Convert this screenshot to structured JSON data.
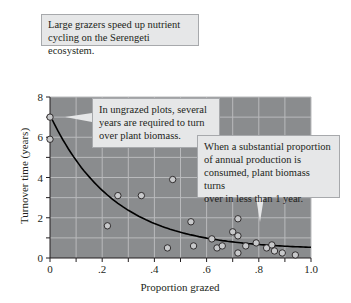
{
  "title_box": {
    "line1": "Large grazers speed up nutrient",
    "line2": "cycling on the Serengeti ecosystem."
  },
  "callouts": [
    {
      "lines": [
        "In ungrazed plots, several",
        "years are required to turn",
        "over plant biomass."
      ]
    },
    {
      "lines": [
        "When a substantial proportion",
        "of annual production is",
        "consumed, plant biomass turns",
        "over in less than 1 year."
      ]
    }
  ],
  "colors": {
    "plot_bg": "#8a8c8e",
    "grid": "#b9babc",
    "curve": "#000000",
    "point_fill": "#c8c9cb",
    "point_stroke": "#231f20",
    "callout_bg": "#e6e7e8"
  },
  "chart_data": {
    "type": "scatter",
    "title": "Large grazers speed up nutrient cycling on the Serengeti ecosystem.",
    "xlabel": "Proportion grazed",
    "ylabel": "Turnover time (years)",
    "xlim": [
      0,
      1.0
    ],
    "ylim": [
      0,
      8
    ],
    "x_ticks": [
      0,
      0.1,
      0.2,
      0.3,
      0.4,
      0.5,
      0.6,
      0.7,
      0.8,
      0.9,
      1.0
    ],
    "x_tick_labels": [
      "0",
      ".2",
      ".4",
      ".6",
      ".8",
      "1.0"
    ],
    "y_ticks": [
      0,
      1,
      2,
      3,
      4,
      5,
      6,
      7,
      8
    ],
    "y_tick_labels": [
      "0",
      "2",
      "4",
      "6",
      "8"
    ],
    "grid": true,
    "series": [
      {
        "name": "Plots",
        "points": [
          [
            0.0,
            7.0
          ],
          [
            0.0,
            5.9
          ],
          [
            0.22,
            1.6
          ],
          [
            0.26,
            3.1
          ],
          [
            0.35,
            3.1
          ],
          [
            0.45,
            0.5
          ],
          [
            0.47,
            3.9
          ],
          [
            0.54,
            1.8
          ],
          [
            0.55,
            0.6
          ],
          [
            0.62,
            0.95
          ],
          [
            0.64,
            0.5
          ],
          [
            0.66,
            0.6
          ],
          [
            0.7,
            1.3
          ],
          [
            0.72,
            1.95
          ],
          [
            0.72,
            1.1
          ],
          [
            0.72,
            0.25
          ],
          [
            0.75,
            0.6
          ],
          [
            0.79,
            0.75
          ],
          [
            0.83,
            0.5
          ],
          [
            0.85,
            0.65
          ],
          [
            0.86,
            0.35
          ],
          [
            0.89,
            0.25
          ],
          [
            0.94,
            0.15
          ]
        ]
      },
      {
        "name": "Fitted curve (exponential decay)",
        "type": "line",
        "points": [
          [
            0.0,
            7.1
          ],
          [
            0.1,
            4.9
          ],
          [
            0.2,
            3.4
          ],
          [
            0.3,
            2.4
          ],
          [
            0.4,
            1.75
          ],
          [
            0.5,
            1.3
          ],
          [
            0.6,
            1.0
          ],
          [
            0.7,
            0.8
          ],
          [
            0.8,
            0.65
          ],
          [
            0.9,
            0.55
          ],
          [
            1.0,
            0.5
          ]
        ]
      }
    ],
    "annotations": [
      "In ungrazed plots, several years are required to turn over plant biomass.",
      "When a substantial proportion of annual production is consumed, plant biomass turns over in less than 1 year."
    ]
  }
}
